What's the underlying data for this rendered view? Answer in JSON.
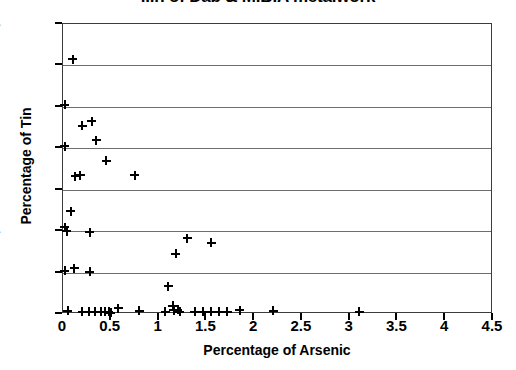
{
  "chart_data": {
    "type": "scatter",
    "title": "...n of Dab & M.B.A metalwork",
    "xlabel": "Percentage of Arsenic",
    "ylabel": "Percentage of Tin",
    "xlim": [
      0,
      4.5
    ],
    "ylim": [
      0,
      14
    ],
    "xticks": [
      "0",
      "0.5",
      "1",
      "1.5",
      "2",
      "2.5",
      "3",
      "3.5",
      "4",
      "4.5"
    ],
    "xtick_values": [
      0,
      0.5,
      1,
      1.5,
      2,
      2.5,
      3,
      3.5,
      4,
      4.5
    ],
    "yticks": [
      "0",
      "2",
      "4",
      "6",
      "8",
      "10",
      "12",
      "14"
    ],
    "ytick_values": [
      0,
      2,
      4,
      6,
      8,
      10,
      12,
      14
    ],
    "grid": "horizontal",
    "gridline_values": [
      2,
      4,
      6,
      8,
      10,
      12,
      14
    ],
    "legend": "none",
    "marker": "plus",
    "marker_color": "#000000",
    "series": [
      {
        "name": "Dab & M.B.A metalwork",
        "points": [
          [
            0.1,
            12.3
          ],
          [
            0.02,
            10.1
          ],
          [
            0.2,
            9.1
          ],
          [
            0.3,
            9.3
          ],
          [
            0.35,
            8.4
          ],
          [
            0.02,
            8.1
          ],
          [
            0.45,
            7.4
          ],
          [
            0.75,
            6.7
          ],
          [
            0.13,
            6.65
          ],
          [
            0.18,
            6.7
          ],
          [
            0.08,
            4.95
          ],
          [
            0.02,
            4.2
          ],
          [
            0.04,
            4.0
          ],
          [
            0.28,
            3.95
          ],
          [
            1.3,
            3.65
          ],
          [
            1.55,
            3.45
          ],
          [
            1.18,
            2.9
          ],
          [
            0.02,
            2.1
          ],
          [
            0.12,
            2.2
          ],
          [
            0.28,
            2.05
          ],
          [
            1.1,
            1.35
          ],
          [
            1.15,
            0.4
          ],
          [
            0.05,
            0.15
          ],
          [
            0.2,
            0.1
          ],
          [
            0.27,
            0.1
          ],
          [
            0.33,
            0.1
          ],
          [
            0.4,
            0.1
          ],
          [
            0.44,
            0.12
          ],
          [
            0.48,
            0.1
          ],
          [
            0.5,
            0.05
          ],
          [
            0.58,
            0.28
          ],
          [
            0.8,
            0.15
          ],
          [
            1.07,
            0.1
          ],
          [
            1.16,
            0.18
          ],
          [
            1.2,
            0.2
          ],
          [
            1.22,
            0.12
          ],
          [
            1.38,
            0.12
          ],
          [
            1.47,
            0.12
          ],
          [
            1.55,
            0.12
          ],
          [
            1.63,
            0.12
          ],
          [
            1.72,
            0.12
          ],
          [
            1.85,
            0.18
          ],
          [
            2.2,
            0.15
          ],
          [
            3.1,
            0.1
          ]
        ]
      }
    ]
  }
}
